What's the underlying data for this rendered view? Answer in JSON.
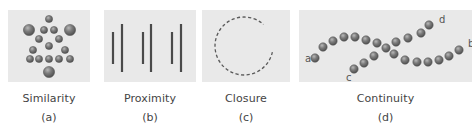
{
  "figure": {
    "colors": {
      "page_background": "#ffffff",
      "panel_background": "#e9e9e9",
      "dot_fill": "#7c7c7c",
      "dot_stroke": "#505050",
      "line_color": "#4a4a4a",
      "text_color": "#444444"
    },
    "panels": [
      {
        "id": "similarity",
        "title": "Similarity",
        "label": "(a)",
        "x": 8,
        "width": 82,
        "circles": [
          {
            "cx": 41,
            "cy": 9,
            "r": 3.6
          },
          {
            "cx": 21,
            "cy": 20,
            "r": 5.6
          },
          {
            "cx": 36,
            "cy": 20,
            "r": 3.6
          },
          {
            "cx": 46,
            "cy": 20,
            "r": 3.6
          },
          {
            "cx": 62,
            "cy": 20,
            "r": 5.6
          },
          {
            "cx": 31,
            "cy": 29,
            "r": 3.6
          },
          {
            "cx": 51,
            "cy": 29,
            "r": 3.6
          },
          {
            "cx": 41,
            "cy": 36,
            "r": 3.6
          },
          {
            "cx": 25,
            "cy": 40,
            "r": 3.6
          },
          {
            "cx": 57,
            "cy": 40,
            "r": 3.6
          },
          {
            "cx": 22,
            "cy": 49,
            "r": 3.6
          },
          {
            "cx": 31,
            "cy": 49,
            "r": 3.6
          },
          {
            "cx": 41,
            "cy": 49,
            "r": 3.6
          },
          {
            "cx": 51,
            "cy": 49,
            "r": 3.6
          },
          {
            "cx": 62,
            "cy": 49,
            "r": 3.6
          },
          {
            "cx": 41,
            "cy": 62,
            "r": 5.6
          }
        ]
      },
      {
        "id": "proximity",
        "title": "Proximity",
        "label": "(b)",
        "x": 104,
        "width": 92,
        "lines": [
          {
            "x": 9,
            "y1": 22,
            "y2": 54
          },
          {
            "x": 18,
            "y1": 14,
            "y2": 62
          },
          {
            "x": 39,
            "y1": 22,
            "y2": 54
          },
          {
            "x": 47,
            "y1": 14,
            "y2": 62
          },
          {
            "x": 68,
            "y1": 22,
            "y2": 54
          },
          {
            "x": 77,
            "y1": 14,
            "y2": 62
          }
        ]
      },
      {
        "id": "closure",
        "title": "Closure",
        "label": "(c)",
        "x": 202,
        "width": 88,
        "arc": {
          "cx": 42,
          "cy": 36,
          "r": 29,
          "gap_start_deg": -48,
          "gap_end_deg": 12
        }
      },
      {
        "id": "continuity",
        "title": "Continuity",
        "label": "(d)",
        "x": 299,
        "width": 173,
        "endpoint_labels": [
          {
            "text": "a",
            "x": 6,
            "y": 52
          },
          {
            "text": "b",
            "x": 169,
            "y": 37
          },
          {
            "text": "c",
            "x": 47,
            "y": 71
          },
          {
            "text": "d",
            "x": 140,
            "y": 13
          }
        ],
        "dots": [
          {
            "cx": 16,
            "cy": 48
          },
          {
            "cx": 24,
            "cy": 37
          },
          {
            "cx": 34,
            "cy": 31
          },
          {
            "cx": 45,
            "cy": 27
          },
          {
            "cx": 56,
            "cy": 27
          },
          {
            "cx": 67,
            "cy": 30
          },
          {
            "cx": 78,
            "cy": 33
          },
          {
            "cx": 87,
            "cy": 38
          },
          {
            "cx": 95,
            "cy": 44
          },
          {
            "cx": 106,
            "cy": 50
          },
          {
            "cx": 118,
            "cy": 52
          },
          {
            "cx": 129,
            "cy": 52
          },
          {
            "cx": 140,
            "cy": 50
          },
          {
            "cx": 150,
            "cy": 46
          },
          {
            "cx": 160,
            "cy": 40
          },
          {
            "cx": 55,
            "cy": 59
          },
          {
            "cx": 65,
            "cy": 53
          },
          {
            "cx": 75,
            "cy": 46
          },
          {
            "cx": 97,
            "cy": 32
          },
          {
            "cx": 109,
            "cy": 28
          },
          {
            "cx": 122,
            "cy": 23
          },
          {
            "cx": 130,
            "cy": 15
          }
        ],
        "dot_radius": 4.2
      }
    ]
  }
}
